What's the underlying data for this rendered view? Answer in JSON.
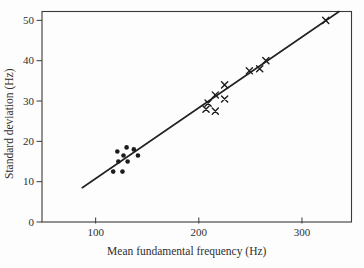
{
  "colors": {
    "background": "#fdfdfd",
    "axis": "#3a3a3a",
    "text": "#2f2f2f",
    "marks": "#1c1c1c",
    "trendline": "#222222"
  },
  "chart_data": {
    "type": "scatter",
    "title": "",
    "xlabel": "Mean fundamental frequency (Hz)",
    "ylabel": "Standard deviation (Hz)",
    "xlim": [
      48,
      348
    ],
    "ylim": [
      0,
      52.2
    ],
    "xticks": [
      100,
      200,
      300
    ],
    "yticks": [
      0,
      10,
      20,
      30,
      40,
      50
    ],
    "grid": false,
    "legend": "none",
    "series": [
      {
        "name": "dots",
        "marker": "circle",
        "points": [
          [
            117,
            12.5
          ],
          [
            121,
            17.5
          ],
          [
            122,
            15
          ],
          [
            126,
            12.5
          ],
          [
            127,
            16.5
          ],
          [
            130,
            18.5
          ],
          [
            131,
            15
          ],
          [
            137,
            18
          ],
          [
            141,
            16.5
          ]
        ]
      },
      {
        "name": "crosses",
        "marker": "x",
        "points": [
          [
            207,
            28
          ],
          [
            209,
            29.5
          ],
          [
            216,
            27.5
          ],
          [
            216,
            31.5
          ],
          [
            225,
            30.5
          ],
          [
            225,
            34
          ],
          [
            249,
            37.5
          ],
          [
            259,
            38
          ],
          [
            265,
            40
          ],
          [
            323,
            50
          ]
        ]
      }
    ],
    "trendline": {
      "x1": 87,
      "y1": 8.5,
      "x2": 336,
      "y2": 52.2
    }
  }
}
